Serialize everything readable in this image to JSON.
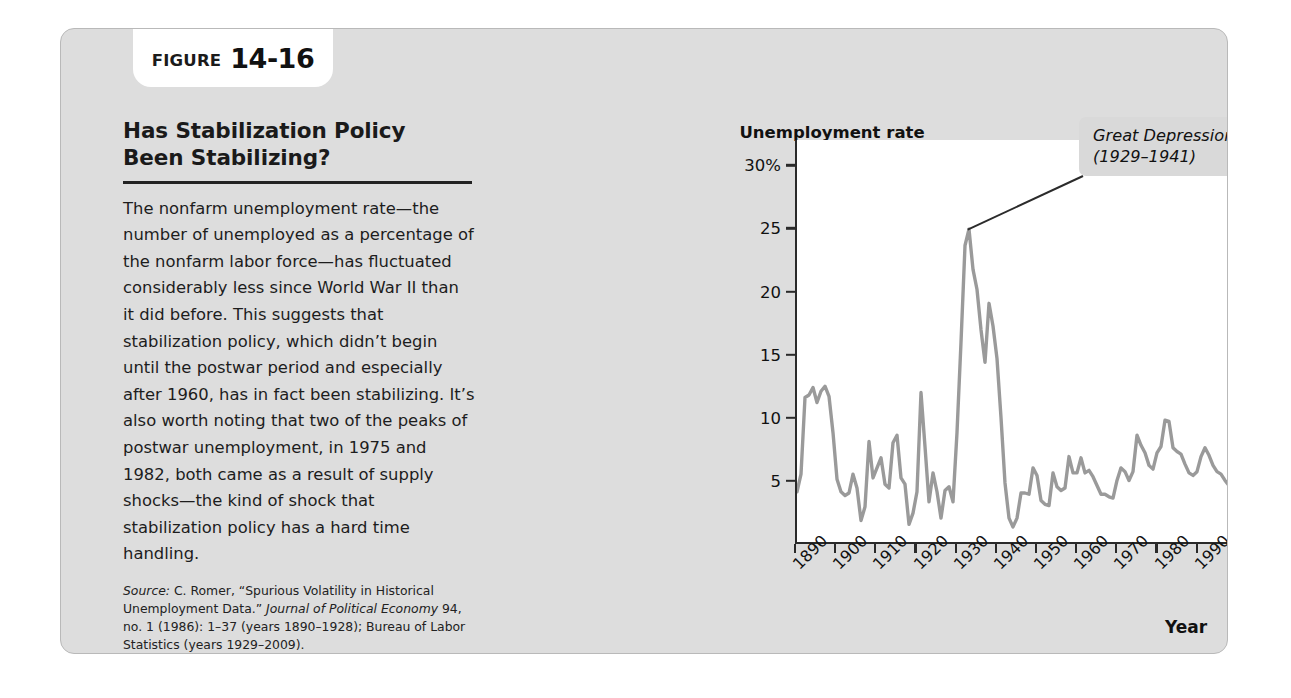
{
  "figure": {
    "tab_word": "FIGURE",
    "tab_number": "14-16",
    "heading": "Has Stabilization Policy Been Stabilizing?",
    "body": "The nonfarm unemployment rate—the number of unemployed as a percentage of the nonfarm labor force—has fluctuated considerably less since World War II than it did before. This suggests that stabilization policy, which didn’t begin until the postwar period and especially after 1960, has in fact been stabilizing. It’s also worth noting that two of the peaks of postwar unemployment, in 1975 and 1982, both came as a result of supply shocks—the kind of shock that stabilization policy has a hard time handling.",
    "source_label": "Source:",
    "source_text_1": " C. Romer, “Spurious Volatility in Historical Unemployment Data.” ",
    "source_italic": "Journal of Political Economy",
    "source_text_2": " 94, no. 1 (1986): 1–37 (years 1890–1928); Bureau of Labor Statistics (years 1929–2009)."
  },
  "chart_data": {
    "type": "line",
    "title": "Has Stabilization Policy Been Stabilizing?",
    "ylabel": "Unemployment rate",
    "xlabel": "Year",
    "ylim": [
      0,
      32
    ],
    "xlim": [
      1890,
      2009
    ],
    "grid": false,
    "legend": "none",
    "line_color": "#9a9a9a",
    "plot_background": "#ffffff",
    "ytick_labels": [
      "5",
      "10",
      "15",
      "20",
      "25",
      "30%"
    ],
    "ytick_values": [
      5,
      10,
      15,
      20,
      25,
      30
    ],
    "xtick_labels": [
      "1890",
      "1900",
      "1910",
      "1920",
      "1930",
      "1940",
      "1950",
      "1960",
      "1970",
      "1980",
      "1990",
      "2000",
      "2009"
    ],
    "xtick_values": [
      1890,
      1900,
      1910,
      1920,
      1930,
      1940,
      1950,
      1960,
      1970,
      1980,
      1990,
      2000,
      2009
    ],
    "annotations": [
      {
        "text": "Great Depression\n(1929–1941)",
        "points_to_x": 1933,
        "points_to_y": 24.9
      }
    ],
    "series": [
      {
        "name": "Nonfarm unemployment rate",
        "x": [
          1890,
          1891,
          1892,
          1893,
          1894,
          1895,
          1896,
          1897,
          1898,
          1899,
          1900,
          1901,
          1902,
          1903,
          1904,
          1905,
          1906,
          1907,
          1908,
          1909,
          1910,
          1911,
          1912,
          1913,
          1914,
          1915,
          1916,
          1917,
          1918,
          1919,
          1920,
          1921,
          1922,
          1923,
          1924,
          1925,
          1926,
          1927,
          1928,
          1929,
          1930,
          1931,
          1932,
          1933,
          1934,
          1935,
          1936,
          1937,
          1938,
          1939,
          1940,
          1941,
          1942,
          1943,
          1944,
          1945,
          1946,
          1947,
          1948,
          1949,
          1950,
          1951,
          1952,
          1953,
          1954,
          1955,
          1956,
          1957,
          1958,
          1959,
          1960,
          1961,
          1962,
          1963,
          1964,
          1965,
          1966,
          1967,
          1968,
          1969,
          1970,
          1971,
          1972,
          1973,
          1974,
          1975,
          1976,
          1977,
          1978,
          1979,
          1980,
          1981,
          1982,
          1983,
          1984,
          1985,
          1986,
          1987,
          1988,
          1989,
          1990,
          1991,
          1992,
          1993,
          1994,
          1995,
          1996,
          1997,
          1998,
          1999,
          2000,
          2001,
          2002,
          2003,
          2004,
          2005,
          2006,
          2007,
          2008,
          2009
        ],
        "values": [
          4.0,
          5.4,
          11.5,
          11.7,
          12.3,
          11.1,
          12.0,
          12.4,
          11.6,
          8.7,
          5.0,
          4.0,
          3.7,
          3.9,
          5.4,
          4.3,
          1.7,
          2.8,
          8.0,
          5.1,
          5.9,
          6.7,
          4.6,
          4.3,
          7.9,
          8.5,
          5.1,
          4.6,
          1.4,
          2.3,
          4.0,
          11.9,
          7.6,
          3.2,
          5.5,
          4.0,
          1.9,
          4.1,
          4.4,
          3.2,
          8.7,
          15.9,
          23.6,
          24.9,
          21.7,
          20.1,
          16.9,
          14.3,
          19.0,
          17.2,
          14.6,
          9.9,
          4.7,
          1.9,
          1.2,
          1.9,
          3.9,
          3.9,
          3.8,
          5.9,
          5.3,
          3.3,
          3.0,
          2.9,
          5.5,
          4.4,
          4.1,
          4.3,
          6.8,
          5.5,
          5.5,
          6.7,
          5.5,
          5.7,
          5.2,
          4.5,
          3.8,
          3.8,
          3.6,
          3.5,
          4.9,
          5.9,
          5.6,
          4.9,
          5.6,
          8.5,
          7.7,
          7.1,
          6.1,
          5.8,
          7.1,
          7.6,
          9.7,
          9.6,
          7.5,
          7.2,
          7.0,
          6.2,
          5.5,
          5.3,
          5.6,
          6.8,
          7.5,
          6.9,
          6.1,
          5.6,
          5.4,
          4.9,
          4.5,
          4.2,
          4.0,
          4.7,
          5.8,
          6.0,
          5.5,
          5.1,
          4.6,
          4.6,
          5.8,
          9.3
        ]
      }
    ]
  }
}
